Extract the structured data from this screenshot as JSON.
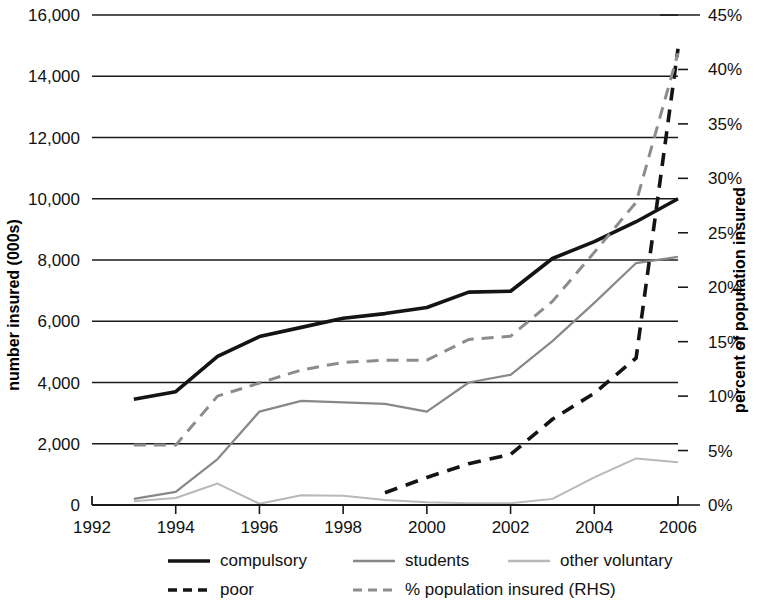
{
  "chart_data": {
    "type": "line",
    "title": "",
    "xlabel": "",
    "ylabel": "number insured (000s)",
    "y2label": "percent of population insured",
    "x": [
      1992,
      1993,
      1994,
      1995,
      1996,
      1997,
      1998,
      1999,
      2000,
      2001,
      2002,
      2003,
      2004,
      2005,
      2006
    ],
    "xlim": [
      1992,
      2006
    ],
    "xticks": [
      1992,
      1994,
      1996,
      1998,
      2000,
      2002,
      2004,
      2006
    ],
    "xticklabels": [
      "1992",
      "1994",
      "1996",
      "1998",
      "2000",
      "2002",
      "2004",
      "2006"
    ],
    "ylim": [
      0,
      16000
    ],
    "yticks": [
      0,
      2000,
      4000,
      6000,
      8000,
      10000,
      12000,
      14000,
      16000
    ],
    "yticklabels": [
      "0",
      "2,000",
      "4,000",
      "6,000",
      "8,000",
      "10,000",
      "12,000",
      "14,000",
      "16,000"
    ],
    "y2lim": [
      0,
      45
    ],
    "y2ticks": [
      0,
      5,
      10,
      15,
      20,
      25,
      30,
      35,
      40,
      45
    ],
    "y2ticklabels": [
      "0%",
      "5%",
      "10%",
      "15%",
      "20%",
      "25%",
      "30%",
      "35%",
      "40%",
      "45%"
    ],
    "grid": true,
    "legend_position": "bottom",
    "series": [
      {
        "name": "compulsory",
        "axis": "left",
        "style": "solid",
        "color": "#141414",
        "width": 3.6,
        "x": [
          1993,
          1994,
          1995,
          1996,
          1997,
          1998,
          1999,
          2000,
          2001,
          2002,
          2003,
          2004,
          2005,
          2006
        ],
        "values": [
          3450,
          3700,
          4850,
          5500,
          5800,
          6100,
          6250,
          6450,
          6950,
          6980,
          8050,
          8600,
          9250,
          10000
        ]
      },
      {
        "name": "students",
        "axis": "left",
        "style": "solid",
        "color": "#888888",
        "width": 2.2,
        "x": [
          1993,
          1994,
          1995,
          1996,
          1997,
          1998,
          1999,
          2000,
          2001,
          2002,
          2003,
          2004,
          2005,
          2006
        ],
        "values": [
          200,
          430,
          1500,
          3050,
          3400,
          3350,
          3300,
          3050,
          4000,
          4250,
          5350,
          6600,
          7900,
          8100
        ]
      },
      {
        "name": "other voluntary",
        "axis": "left",
        "style": "solid",
        "color": "#b9b9b9",
        "width": 2.0,
        "x": [
          1993,
          1994,
          1995,
          1996,
          1997,
          1998,
          1999,
          2000,
          2001,
          2002,
          2003,
          2004,
          2005,
          2006
        ],
        "values": [
          120,
          230,
          700,
          40,
          320,
          300,
          160,
          90,
          60,
          55,
          200,
          900,
          1520,
          1400
        ]
      },
      {
        "name": "poor",
        "axis": "left",
        "style": "dashed",
        "color": "#141414",
        "width": 3.6,
        "dash": "13,9",
        "x": [
          1999,
          2000,
          2001,
          2002,
          2003,
          2004,
          2005,
          2006
        ],
        "values": [
          400,
          900,
          1350,
          1650,
          2800,
          3650,
          4800,
          14900
        ]
      },
      {
        "name": "% population insured (RHS)",
        "axis": "right",
        "style": "dashed",
        "color": "#8c8c8c",
        "width": 3.0,
        "dash": "12,8",
        "x": [
          1993,
          1994,
          1995,
          1996,
          1997,
          1998,
          1999,
          2000,
          2001,
          2002,
          2003,
          2004,
          2005,
          2006
        ],
        "values": [
          5.5,
          5.5,
          10.0,
          11.2,
          12.4,
          13.1,
          13.3,
          13.3,
          15.2,
          15.5,
          18.7,
          23.2,
          27.8,
          41.5
        ]
      }
    ],
    "legend": [
      {
        "label": "compulsory",
        "style": "solid",
        "color": "#141414",
        "width": 3.6,
        "dash": ""
      },
      {
        "label": "students",
        "style": "solid",
        "color": "#888888",
        "width": 2.6,
        "dash": ""
      },
      {
        "label": "other voluntary",
        "style": "solid",
        "color": "#b9b9b9",
        "width": 2.4,
        "dash": ""
      },
      {
        "label": "poor",
        "style": "dashed",
        "color": "#141414",
        "width": 3.6,
        "dash": "9,6"
      },
      {
        "label": "% population insured (RHS)",
        "style": "dashed",
        "color": "#8c8c8c",
        "width": 3.0,
        "dash": "9,6"
      }
    ]
  }
}
